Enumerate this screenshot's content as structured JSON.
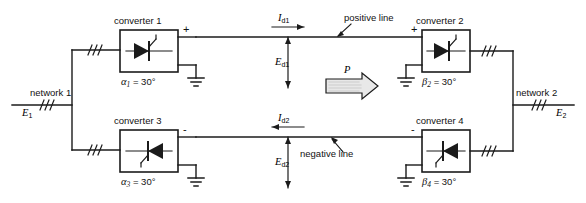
{
  "diagram": {
    "colors": {
      "line": "#1b1b1b",
      "text": "#111111",
      "arrow_fill": "#e8e8e8",
      "background": "#ffffff"
    },
    "networks": [
      {
        "id": "network-1",
        "label": "network 1",
        "voltage_symbol": "E",
        "voltage_sub": "1"
      },
      {
        "id": "network-2",
        "label": "network 2",
        "voltage_symbol": "E",
        "voltage_sub": "2"
      }
    ],
    "converters": [
      {
        "id": "converter-1",
        "label": "converter 1",
        "angle_symbol": "α",
        "angle_sub": "1",
        "angle_text": "= 30°",
        "angle_value": 30,
        "angle_unit": "°",
        "terminal_sign": "+",
        "thyristor_direction": "right"
      },
      {
        "id": "converter-2",
        "label": "converter 2",
        "angle_symbol": "β",
        "angle_sub": "2",
        "angle_text": "= 30°",
        "angle_value": 30,
        "angle_unit": "°",
        "terminal_sign": "+",
        "thyristor_direction": "right"
      },
      {
        "id": "converter-3",
        "label": "converter 3",
        "angle_symbol": "α",
        "angle_sub": "3",
        "angle_text": "= 30°",
        "angle_value": 30,
        "angle_unit": "°",
        "terminal_sign": "-",
        "thyristor_direction": "left"
      },
      {
        "id": "converter-4",
        "label": "converter 4",
        "angle_symbol": "β",
        "angle_sub": "4",
        "angle_text": "= 30°",
        "angle_value": 30,
        "angle_unit": "°",
        "terminal_sign": "-",
        "thyristor_direction": "left"
      }
    ],
    "lines": [
      {
        "id": "positive-line",
        "label": "positive line",
        "current_symbol": "I",
        "current_sub": "d1",
        "voltage_symbol": "E",
        "voltage_sub": "d1",
        "current_arrow_direction": "right"
      },
      {
        "id": "negative-line",
        "label": "negative line",
        "current_symbol": "I",
        "current_sub": "d2",
        "voltage_symbol": "E",
        "voltage_sub": "d2",
        "current_arrow_direction": "left"
      }
    ],
    "power_flow": {
      "label": "P",
      "direction": "right"
    }
  }
}
